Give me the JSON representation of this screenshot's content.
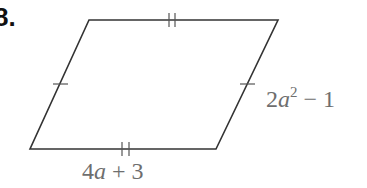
{
  "problem": {
    "number": "8."
  },
  "figure": {
    "type": "parallelogram",
    "stroke_color": "#333333",
    "label_color": "#6e6e6e",
    "vertices": {
      "top_left": [
        89,
        20
      ],
      "top_right": [
        278,
        20
      ],
      "bottom_right": [
        216,
        149
      ],
      "bottom_left": [
        30,
        149
      ]
    },
    "tick_marks": {
      "left_side": "single",
      "right_side": "single",
      "top_side": "double",
      "bottom_side": "double"
    },
    "labels": {
      "right_side": {
        "coef": "2",
        "var": "a",
        "exp": "2",
        "rest": " − 1",
        "full": "2a^2 − 1"
      },
      "bottom_side": {
        "coef": "4",
        "var": "a",
        "rest": " + 3",
        "full": "4a + 3"
      }
    }
  }
}
